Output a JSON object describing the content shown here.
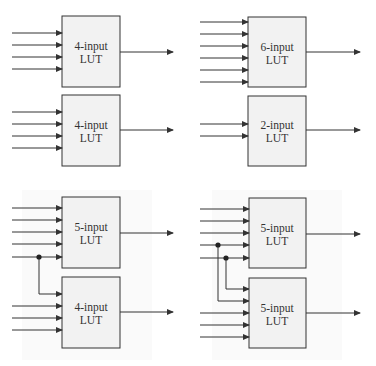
{
  "colors": {
    "line": "#333333",
    "box_fill": "#f2f2f2",
    "box_stroke": "#333333",
    "panel_bg": "#fbfbfb"
  },
  "panels": [
    {
      "id": "top-left",
      "luts": [
        {
          "label_line1": "4-input",
          "label_line2": "LUT"
        },
        {
          "label_line1": "4-input",
          "label_line2": "LUT"
        }
      ]
    },
    {
      "id": "top-right",
      "luts": [
        {
          "label_line1": "6-input",
          "label_line2": "LUT"
        },
        {
          "label_line1": "2-input",
          "label_line2": "LUT"
        }
      ]
    },
    {
      "id": "bottom-left",
      "luts": [
        {
          "label_line1": "5-input",
          "label_line2": "LUT"
        },
        {
          "label_line1": "4-input",
          "label_line2": "LUT"
        }
      ]
    },
    {
      "id": "bottom-right",
      "luts": [
        {
          "label_line1": "5-input",
          "label_line2": "LUT"
        },
        {
          "label_line1": "5-input",
          "label_line2": "LUT"
        }
      ]
    }
  ]
}
